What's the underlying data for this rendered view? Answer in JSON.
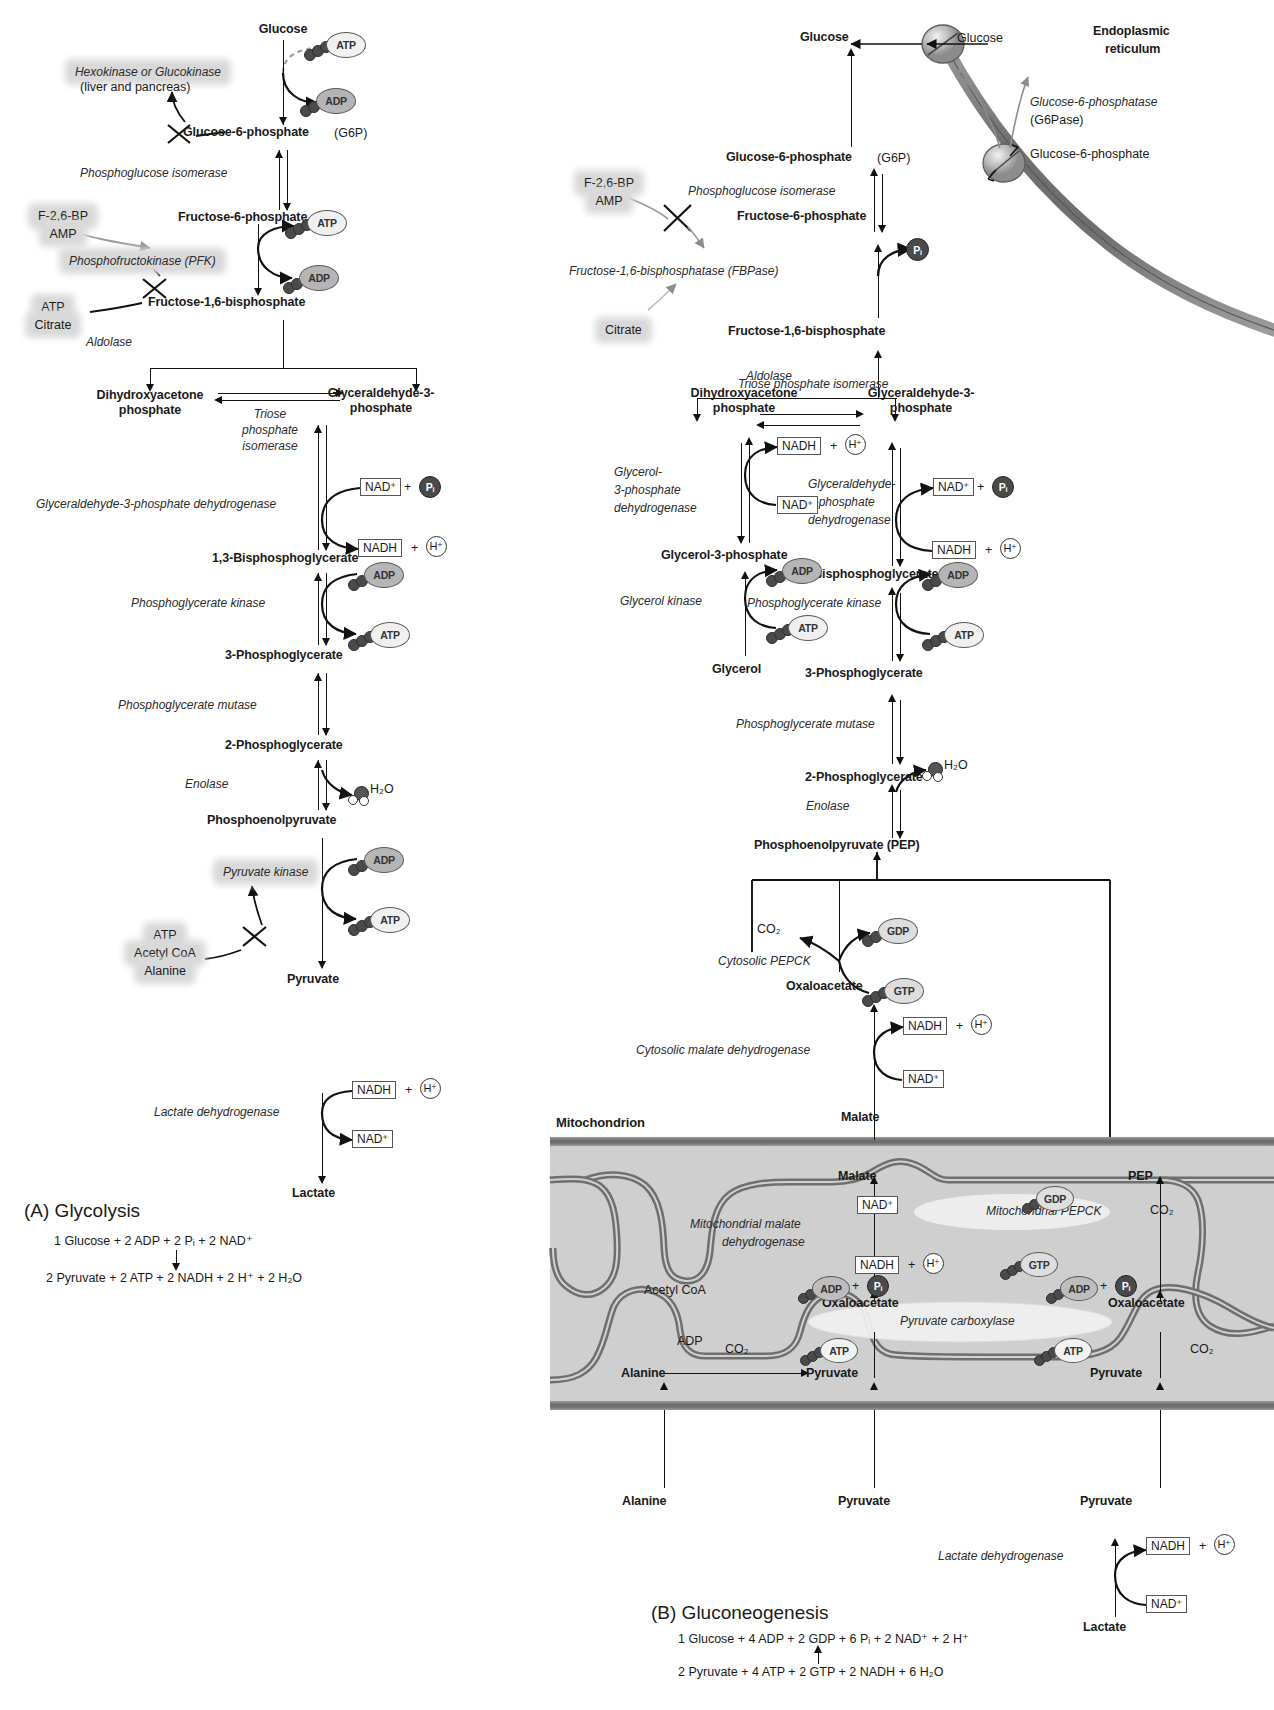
{
  "figure": {
    "panelA": {
      "label": "(A) Glycolysis",
      "equation_top": "1 Glucose + 2 ADP + 2 Pᵢ + 2 NAD⁺",
      "equation_bottom": "2 Pyruvate + 2 ATP + 2 NADH + 2 H⁺ + 2 H₂O"
    },
    "panelB": {
      "label": "(B) Gluconeogenesis",
      "equation_top": "1 Glucose + 4 ADP + 2 GDP + 6 Pᵢ + 2 NAD⁺ + 2 H⁺",
      "equation_bottom": "2 Pyruvate + 4 ATP + 2 GTP + 2 NADH + 6 H₂O"
    }
  },
  "glycolysis": {
    "metabolites": [
      "Glucose",
      "Glucose-6-phosphate",
      "Fructose-6-phosphate",
      "Fructose-1,6-bisphosphate",
      "Dihydroxyacetone phosphate",
      "Glyceraldehyde-3-phosphate",
      "1,3-Bisphosphoglycerate",
      "3-Phosphoglycerate",
      "2-Phosphoglycerate",
      "Phosphoenolpyruvate",
      "Pyruvate",
      "Lactate"
    ],
    "g6p_abbrev": "(G6P)",
    "enzymes": [
      "Hexokinase or Glucokinase",
      "(liver and pancreas)",
      "Phosphoglucose isomerase",
      "Phosphofructokinase (PFK)",
      "Aldolase",
      "Triose phosphate isomerase",
      "Glyceraldehyde-3-phosphate dehydrogenase",
      "Phosphoglycerate kinase",
      "Phosphoglycerate mutase",
      "Enolase",
      "Pyruvate kinase",
      "Lactate dehydrogenase"
    ],
    "enzyme_lines": {
      "hexokinase_l1": "Hexokinase or Glucokinase",
      "hexokinase_l2": "(liver and pancreas)",
      "tpi_l1": "Triose",
      "tpi_l2": "phosphate",
      "tpi_l3": "isomerase"
    },
    "regulators": {
      "pfk_activators_l1": "F-2,6-BP",
      "pfk_activators_l2": "AMP",
      "pfk_inhibitors_l1": "ATP",
      "pfk_inhibitors_l2": "Citrate",
      "pk_inhibitors_l1": "ATP",
      "pk_inhibitors_l2": "Acetyl CoA",
      "pk_inhibitors_l3": "Alanine"
    },
    "cofactors": {
      "atp": "ATP",
      "adp": "ADP",
      "nad_plus": "NAD⁺",
      "nadh": "NADH",
      "h_plus": "H⁺",
      "pi": "Pᵢ",
      "water": "H₂O"
    }
  },
  "gluconeogenesis": {
    "metabolites": [
      "Glucose",
      "Glucose-6-phosphate",
      "Fructose-6-phosphate",
      "Fructose-1,6-bisphosphate",
      "Dihydroxyacetone phosphate",
      "Glyceraldehyde-3-phosphate",
      "Glycerol-3-phosphate",
      "Glycerol",
      "1,3-Bisphosphoglycerate",
      "3-Phosphoglycerate",
      "2-Phosphoglycerate",
      "Phosphoenolpyruvate (PEP)",
      "Oxaloacetate",
      "Malate",
      "Pyruvate",
      "Alanine",
      "Lactate"
    ],
    "er": {
      "label_l1": "Endoplasmic",
      "label_l2": "reticulum",
      "glucose_out": "Glucose",
      "g6p_in": "Glucose-6-phosphate",
      "enzyme_l1": "Glucose-6-phosphatase",
      "enzyme_l2": "(G6Pase)"
    },
    "enzymes": [
      "Phosphoglucose isomerase",
      "Fructose-1,6-bisphosphatase (FBPase)",
      "Aldolase",
      "Triose phosphate isomerase",
      "Glycerol-3-phosphate dehydrogenase",
      "Glycerol kinase",
      "Glyceraldehyde-3-phosphate dehydrogenase",
      "Phosphoglycerate kinase",
      "Phosphoglycerate mutase",
      "Enolase",
      "Cytosolic PEPCK",
      "Cytosolic malate dehydrogenase",
      "Mitochondrial malate dehydrogenase",
      "Mitochondrial PEPCK",
      "Pyruvate carboxylase",
      "Lactate dehydrogenase"
    ],
    "enzyme_lines": {
      "g3pdh_l1": "Glycerol-",
      "g3pdh_l2": "3-phosphate",
      "g3pdh_l3": "dehydrogenase",
      "gapdh_l1": "Glyceraldehyde-",
      "gapdh_l2": "3-phosphate",
      "gapdh_l3": "dehydrogenase",
      "mmdh_l1": "Mitochondrial malate",
      "mmdh_l2": "dehydrogenase"
    },
    "regulators": {
      "fbpase_inhibitors_l1": "F-2,6-BP",
      "fbpase_inhibitors_l2": "AMP",
      "fbpase_activator": "Citrate",
      "pc_activator": "Acetyl CoA",
      "pc_inhibitor": "ADP"
    },
    "mito_label": "Mitochondrion",
    "cofactors": {
      "atp": "ATP",
      "adp": "ADP",
      "gtp": "GTP",
      "gdp": "GDP",
      "nad_plus": "NAD⁺",
      "nadh": "NADH",
      "h_plus": "H⁺",
      "pi": "Pᵢ",
      "water": "H₂O",
      "co2": "CO₂",
      "pep": "PEP"
    },
    "mito_metabolites": {
      "malate": "Malate",
      "pep": "PEP",
      "oxaloacetate": "Oxaloacetate",
      "pyruvate": "Pyruvate",
      "alanine": "Alanine"
    }
  },
  "colors": {
    "ink": "#1a1a1a",
    "highlight": "#d9d9d9",
    "membrane": "#8a8a8a",
    "mito_fill": "#cfcfcf",
    "phosphate": "#4a4a4a"
  }
}
